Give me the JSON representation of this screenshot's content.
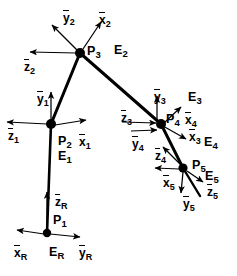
{
  "figure": {
    "type": "diagram",
    "width": 237,
    "height": 276,
    "background": "#ffffff",
    "ink": "#000000"
  },
  "joints": [
    {
      "id": "P1",
      "label": "P",
      "sub": "1",
      "x": 47,
      "y": 233,
      "r": 4.2
    },
    {
      "id": "P2",
      "label": "P",
      "sub": "2",
      "x": 51,
      "y": 124,
      "r": 5.0
    },
    {
      "id": "P3",
      "label": "P",
      "sub": "3",
      "x": 80,
      "y": 53,
      "r": 5.0
    },
    {
      "id": "P4",
      "label": "P",
      "sub": "4",
      "x": 161,
      "y": 124,
      "r": 5.0
    },
    {
      "id": "P5",
      "label": "P",
      "sub": "5",
      "x": 183,
      "y": 168,
      "r": 4.6
    }
  ],
  "links": [
    {
      "from": "P1",
      "to": "P2",
      "width": 2.6
    },
    {
      "from": "P2",
      "to": "P3",
      "width": 3.0
    },
    {
      "from": "P3",
      "to": "P4",
      "width": 3.0
    },
    {
      "from": "P4",
      "to": "P5",
      "width": 3.0
    },
    {
      "from": "P5",
      "to": "tip",
      "width": 2.4
    }
  ],
  "point_labels": [
    {
      "name": "P1",
      "base": "P",
      "sub": "1",
      "x": 53,
      "y": 214
    },
    {
      "name": "P2",
      "base": "P",
      "sub": "2",
      "x": 58,
      "y": 135
    },
    {
      "name": "P3",
      "base": "P",
      "sub": "3",
      "x": 87,
      "y": 45
    },
    {
      "name": "P4",
      "base": "P",
      "sub": "4",
      "x": 166,
      "y": 113
    },
    {
      "name": "P5",
      "base": "P",
      "sub": "5",
      "x": 192,
      "y": 159
    }
  ],
  "frame_labels": [
    {
      "name": "ER",
      "base": "E",
      "sub": "R",
      "x": 49,
      "y": 246
    },
    {
      "name": "E1",
      "base": "E",
      "sub": "1",
      "x": 58,
      "y": 150
    },
    {
      "name": "E2",
      "base": "E",
      "sub": "2",
      "x": 114,
      "y": 44
    },
    {
      "name": "E3",
      "base": "E",
      "sub": "3",
      "x": 188,
      "y": 91
    },
    {
      "name": "E4",
      "base": "E",
      "sub": "4",
      "x": 204,
      "y": 136
    },
    {
      "name": "E5",
      "base": "E",
      "sub": "5",
      "x": 205,
      "y": 170
    }
  ],
  "axis_labels": [
    {
      "name": "xR",
      "base": "x",
      "sub": "R",
      "x": 14,
      "y": 247
    },
    {
      "name": "yR",
      "base": "y",
      "sub": "R",
      "x": 79,
      "y": 247
    },
    {
      "name": "zR",
      "base": "z",
      "sub": "R",
      "x": 55,
      "y": 196
    },
    {
      "name": "z1",
      "base": "z",
      "sub": "1",
      "x": 8,
      "y": 130
    },
    {
      "name": "y1",
      "base": "y",
      "sub": "1",
      "x": 37,
      "y": 93
    },
    {
      "name": "x1",
      "base": "x",
      "sub": "1",
      "x": 79,
      "y": 136
    },
    {
      "name": "z2",
      "base": "z",
      "sub": "2",
      "x": 24,
      "y": 61
    },
    {
      "name": "y2",
      "base": "y",
      "sub": "2",
      "x": 63,
      "y": 12
    },
    {
      "name": "x2",
      "base": "x",
      "sub": "2",
      "x": 99,
      "y": 14
    },
    {
      "name": "z3",
      "base": "z",
      "sub": "3",
      "x": 121,
      "y": 112
    },
    {
      "name": "y3",
      "base": "y",
      "sub": "3",
      "x": 154,
      "y": 91
    },
    {
      "name": "x3",
      "base": "x",
      "sub": "3",
      "x": 189,
      "y": 131
    },
    {
      "name": "y4",
      "base": "y",
      "sub": "4",
      "x": 132,
      "y": 138
    },
    {
      "name": "x4",
      "base": "x",
      "sub": "4",
      "x": 185,
      "y": 114
    },
    {
      "name": "z4",
      "base": "z",
      "sub": "4",
      "x": 155,
      "y": 150
    },
    {
      "name": "x5",
      "base": "x",
      "sub": "5",
      "x": 163,
      "y": 177
    },
    {
      "name": "y5",
      "base": "y",
      "sub": "5",
      "x": 183,
      "y": 198
    },
    {
      "name": "z5",
      "base": "z",
      "sub": "5",
      "x": 207,
      "y": 186
    }
  ],
  "axis_arrows": [
    {
      "name": "zR-arrow",
      "x1": 47,
      "y1": 229,
      "x2": 47,
      "y2": 192
    },
    {
      "name": "xR-arrow",
      "x1": 44,
      "y1": 234,
      "x2": 17,
      "y2": 230
    },
    {
      "name": "yR-arrow",
      "x1": 50,
      "y1": 234,
      "x2": 80,
      "y2": 237
    },
    {
      "name": "z1-arrow",
      "x1": 47,
      "y1": 124,
      "x2": 7,
      "y2": 122
    },
    {
      "name": "y1-arrow",
      "x1": 51,
      "y1": 120,
      "x2": 51,
      "y2": 92
    },
    {
      "name": "x1-arrow",
      "x1": 55,
      "y1": 125,
      "x2": 86,
      "y2": 120
    },
    {
      "name": "z2-arrow",
      "x1": 76,
      "y1": 53,
      "x2": 30,
      "y2": 52
    },
    {
      "name": "y2-arrow",
      "x1": 77,
      "y1": 50,
      "x2": 52,
      "y2": 25
    },
    {
      "name": "x2-arrow",
      "x1": 83,
      "y1": 49,
      "x2": 101,
      "y2": 22
    },
    {
      "name": "z3-arrow",
      "x1": 122,
      "y1": 122,
      "x2": 156,
      "y2": 123
    },
    {
      "name": "y3-arrow",
      "x1": 157,
      "y1": 120,
      "x2": 157,
      "y2": 96
    },
    {
      "name": "x3-arrow",
      "x1": 163,
      "y1": 126,
      "x2": 186,
      "y2": 139
    },
    {
      "name": "y4-arrow",
      "x1": 131,
      "y1": 131,
      "x2": 157,
      "y2": 130
    },
    {
      "name": "x4-arrow",
      "x1": 164,
      "y1": 123,
      "x2": 181,
      "y2": 107
    },
    {
      "name": "z4-arrow",
      "x1": 180,
      "y1": 164,
      "x2": 163,
      "y2": 147
    },
    {
      "name": "x5-arrow",
      "x1": 179,
      "y1": 169,
      "x2": 155,
      "y2": 168
    },
    {
      "name": "y5-arrow",
      "x1": 183,
      "y1": 172,
      "x2": 181,
      "y2": 193
    },
    {
      "name": "z5-arrow",
      "x1": 187,
      "y1": 171,
      "x2": 203,
      "y2": 182
    }
  ]
}
